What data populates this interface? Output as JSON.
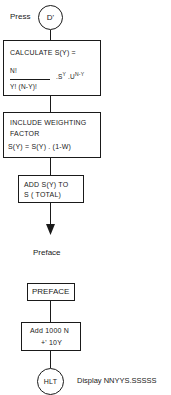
{
  "start": {
    "label": "Press",
    "key": "D'"
  },
  "box_calculate": {
    "line1": "CALCULATE  S(Y)  =",
    "numerator": "N!",
    "denominator": "Y!  (N-Y)!",
    "factor_s": ".S",
    "factor_s_exp": "Y",
    "factor_u": " .U",
    "factor_u_exp": "N-Y"
  },
  "box_weighting": {
    "line1": "INCLUDE  WEIGHTING",
    "line2": "FACTOR",
    "line3": "S(Y) =  S(Y) . (1-W)"
  },
  "box_add": {
    "line1": "ADD  S(Y) TO",
    "line2": "S  ( TOTAL)"
  },
  "connector_label": "Preface",
  "box_preface": {
    "label": "PREFACE"
  },
  "box_add_1000": {
    "line1": "Add  1000 N",
    "line2": "+'  10Y"
  },
  "end": {
    "key": "HLT",
    "display_label": "Display  NNYYS.SSSSS"
  },
  "colors": {
    "line": "#1a1a1a",
    "background": "#ffffff"
  }
}
